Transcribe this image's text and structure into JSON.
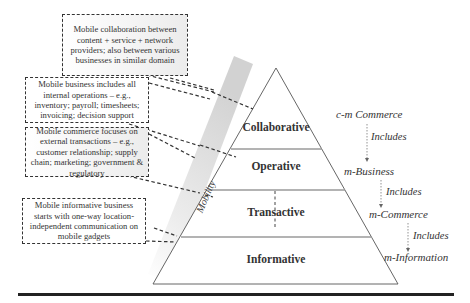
{
  "notes": [
    {
      "id": "collaborative-note",
      "text": "Mobile collaboration between content + service + network providers; also between various businesses in similar domain"
    },
    {
      "id": "business-note",
      "text": "Mobile business includes all internal operations – e.g., inventory; payroll; timesheets; invoicing; decision support"
    },
    {
      "id": "commerce-note",
      "text": "Mobile commerce focuses on external transactions – e.g., customer relationship; supply chain; marketing; government & regulatory"
    },
    {
      "id": "informative-note",
      "text": "Mobile informative business starts with one-way location-independent communication on mobile gadgets"
    }
  ],
  "band": {
    "label": "Mobility"
  },
  "pyramid": {
    "layers": [
      {
        "label": "Collaborative"
      },
      {
        "label": "Operative"
      },
      {
        "label": "Transactive"
      },
      {
        "label": "Informative"
      }
    ]
  },
  "hierarchy": {
    "levels": [
      {
        "label": "c-m Commerce"
      },
      {
        "label": "m-Business"
      },
      {
        "label": "m-Commerce"
      },
      {
        "label": "m-Information"
      }
    ],
    "relation_label": "Includes"
  },
  "colors": {
    "line": "#333333",
    "divider": "#999999",
    "band": "#d6d6d6",
    "rule": "#222222"
  }
}
